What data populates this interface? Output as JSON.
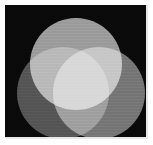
{
  "figure": {
    "width_px": 153,
    "height_px": 145,
    "background_color": "#ffffff",
    "panel_color": "#0a0a0a",
    "panel_edge_color": "#e8e8e8"
  },
  "chart_data": {
    "type": "venn",
    "subtitle": "",
    "xlabel": "",
    "ylabel": "",
    "grid": false,
    "legend_position": "none",
    "background": "#0a0a0a",
    "sets": [
      {
        "name": "top",
        "label": "",
        "semantic": "green-primary",
        "fill_color": "#969696",
        "center_x": 76,
        "center_y": 64,
        "radius": 46,
        "grey_value": 150
      },
      {
        "name": "bottom-left",
        "label": "",
        "semantic": "blue-primary",
        "fill_color": "#4d4d4d",
        "center_x": 63,
        "center_y": 93,
        "radius": 46,
        "grey_value": 77
      },
      {
        "name": "bottom-right",
        "label": "",
        "semantic": "red-primary",
        "fill_color": "#6e6e6e",
        "center_x": 99,
        "center_y": 93,
        "radius": 46,
        "grey_value": 110
      }
    ],
    "intersections": [
      {
        "name": "top-and-bottom-left",
        "semantic": "cyan-mix",
        "fill_color": "#c8c8c8",
        "grey_value": 200
      },
      {
        "name": "top-and-bottom-right",
        "semantic": "yellow-mix",
        "fill_color": "#dcdcdc",
        "grey_value": 220
      },
      {
        "name": "bottom-left-and-bottom-right",
        "semantic": "magenta-mix",
        "fill_color": "#8c8c8c",
        "grey_value": 140
      },
      {
        "name": "all-three",
        "semantic": "white-mix",
        "fill_color": "#ffffff",
        "grey_value": 255
      }
    ],
    "annotations": []
  }
}
